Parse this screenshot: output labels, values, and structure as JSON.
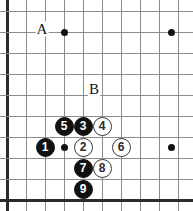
{
  "figure": {
    "type": "go-board-diagram",
    "title": "",
    "board": {
      "width_px": 193,
      "height_px": 211,
      "background_color": "#ffffff",
      "line_color": "#8c8c8c",
      "edge_color": "#2b2b2b",
      "vertical_line_x": [
        7,
        26,
        45,
        64,
        83,
        102,
        121,
        140,
        159,
        178
      ],
      "horizontal_line_y": [
        11,
        32,
        53,
        74,
        95,
        116,
        137,
        158,
        179,
        200
      ],
      "edges": [
        "left",
        "bottom"
      ]
    },
    "star_points": [
      {
        "name": "star-point-top-left",
        "x": 64,
        "y": 32
      },
      {
        "name": "star-point-top-right",
        "x": 171,
        "y": 32
      },
      {
        "name": "star-point-center-left",
        "x": 64,
        "y": 147
      },
      {
        "name": "star-point-center-right",
        "x": 171,
        "y": 147
      }
    ],
    "labels": [
      {
        "name": "label-a",
        "text": "A",
        "x": 42,
        "y": 29
      },
      {
        "name": "label-b",
        "text": "B",
        "x": 94,
        "y": 89
      }
    ],
    "stones": [
      {
        "name": "stone-1",
        "color": "black",
        "number": "1",
        "x": 45,
        "y": 147
      },
      {
        "name": "stone-2",
        "color": "white",
        "number": "2",
        "x": 83,
        "y": 147
      },
      {
        "name": "stone-3",
        "color": "black",
        "number": "3",
        "x": 83,
        "y": 126
      },
      {
        "name": "stone-4",
        "color": "white",
        "number": "4",
        "x": 102,
        "y": 126
      },
      {
        "name": "stone-5",
        "color": "black",
        "number": "5",
        "x": 64,
        "y": 126
      },
      {
        "name": "stone-6",
        "color": "white",
        "number": "6",
        "x": 121,
        "y": 147
      },
      {
        "name": "stone-7",
        "color": "black",
        "number": "7",
        "x": 83,
        "y": 168
      },
      {
        "name": "stone-8",
        "color": "white",
        "number": "8",
        "x": 102,
        "y": 168
      },
      {
        "name": "stone-9",
        "color": "black",
        "number": "9",
        "x": 83,
        "y": 189
      }
    ]
  }
}
